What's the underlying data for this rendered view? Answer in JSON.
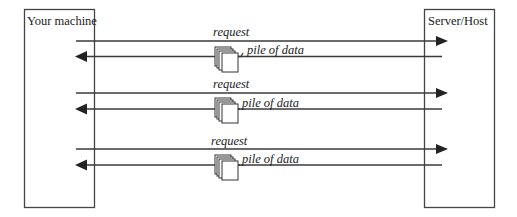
{
  "diagram": {
    "nodes": {
      "client": {
        "label": "Your machine"
      },
      "server": {
        "label": "Server/Host"
      }
    },
    "exchanges": [
      {
        "request_label": "request",
        "response_label": "pile of data",
        "response_icon": "document-stack-icon"
      },
      {
        "request_label": "request",
        "response_label": "pile of data",
        "response_icon": "document-stack-icon"
      },
      {
        "request_label": "request",
        "response_label": "pile of data",
        "response_icon": "document-stack-icon"
      }
    ],
    "colors": {
      "line": "#3a3a3a",
      "arrowhead": "#222222",
      "background": "#ffffff"
    }
  }
}
